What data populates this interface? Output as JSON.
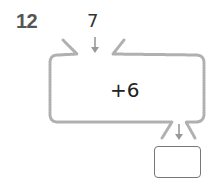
{
  "problem": {
    "number": "12",
    "input": "7",
    "operation": "+6",
    "answer": ""
  },
  "colors": {
    "machine_border": "#b0b0b0",
    "arrow": "#999999",
    "answer_border": "#777777",
    "number_text": "#555555"
  }
}
